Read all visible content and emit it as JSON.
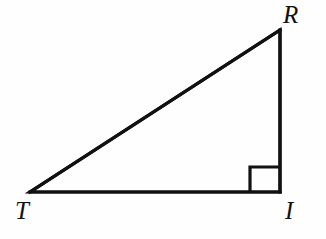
{
  "figure": {
    "kind": "geometry-diagram",
    "shape": "right-triangle",
    "name": "Triangle RTI",
    "background_color": "#fefefe",
    "stroke_color": "#111111",
    "stroke_width": 3.2,
    "canvas": {
      "width": 326,
      "height": 239
    }
  },
  "vertices": [
    {
      "id": "R",
      "label": "R",
      "x": 280,
      "y": 30,
      "label_x": 283,
      "label_y": 2,
      "position": "top-right"
    },
    {
      "id": "T",
      "label": "T",
      "x": 30,
      "y": 192,
      "label_x": 15,
      "label_y": 198,
      "position": "bottom-left"
    },
    {
      "id": "I",
      "label": "I",
      "x": 280,
      "y": 192,
      "label_x": 285,
      "label_y": 198,
      "position": "bottom-right"
    }
  ],
  "sides": [
    {
      "id": "TR",
      "from": "T",
      "to": "R",
      "role": "hypotenuse"
    },
    {
      "id": "TI",
      "from": "T",
      "to": "I",
      "role": "horizontal-leg"
    },
    {
      "id": "IR",
      "from": "I",
      "to": "R",
      "role": "vertical-leg"
    }
  ],
  "angle_markers": [
    {
      "id": "right-angle-I",
      "at_vertex": "I",
      "type": "square",
      "degrees": 90,
      "size": 30,
      "corner_x": 250,
      "corner_y": 167
    }
  ],
  "labels": {
    "R": "R",
    "T": "T",
    "I": "I"
  }
}
